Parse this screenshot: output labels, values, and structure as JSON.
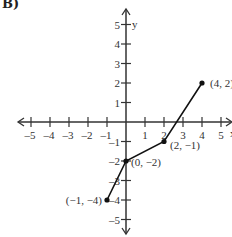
{
  "panel_label": "B)",
  "chart_data": {
    "type": "line",
    "title": "",
    "xlabel": "x",
    "ylabel": "y",
    "xlim": [
      -5,
      5
    ],
    "ylim": [
      -5,
      5
    ],
    "x_ticks": [
      -5,
      -4,
      -3,
      -2,
      -1,
      1,
      2,
      3,
      4,
      5
    ],
    "y_ticks": [
      5,
      4,
      3,
      2,
      1,
      -1,
      -2,
      -3,
      -4,
      -5
    ],
    "grid": false,
    "series": [
      {
        "name": "piecewise",
        "color": "#111111",
        "points": [
          {
            "x": -1,
            "y": -4,
            "label": "(−1, −4)"
          },
          {
            "x": 0,
            "y": -2,
            "label": "(0, −2)"
          },
          {
            "x": 2,
            "y": -1,
            "label": "(2, −1)"
          },
          {
            "x": 4,
            "y": 2,
            "label": "(4, 2)"
          }
        ]
      }
    ]
  }
}
